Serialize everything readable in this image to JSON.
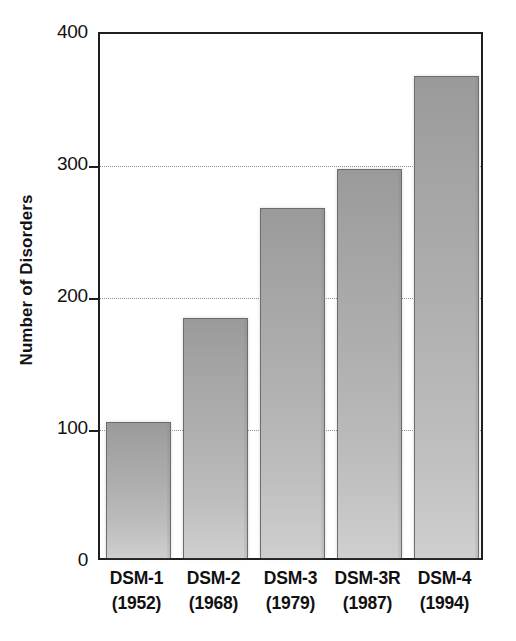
{
  "chart_data": {
    "type": "bar",
    "title": "",
    "subtitle": "",
    "xlabel": "",
    "ylabel": "Number of Disorders",
    "categories": [
      "DSM-1",
      "DSM-2",
      "DSM-3",
      "DSM-3R",
      "DSM-4"
    ],
    "category_years": [
      "(1952)",
      "(1968)",
      "(1979)",
      "(1987)",
      "(1994)"
    ],
    "values": [
      103,
      182,
      265,
      295,
      365
    ],
    "ylim": [
      0,
      400
    ],
    "y_ticks": [
      0,
      100,
      200,
      300,
      400
    ],
    "y_tick_labels": [
      "0",
      "100",
      "200",
      "300",
      "400"
    ],
    "gridlines_at": [
      100,
      200,
      300
    ],
    "grid": true,
    "legend": false,
    "legend_position": "none",
    "bars": [
      {
        "category": "DSM-1",
        "year": "(1952)",
        "label_line1": "DSM-1",
        "label_line2": "(1952)",
        "value": 103
      },
      {
        "category": "DSM-2",
        "year": "(1968)",
        "label_line1": "DSM-2",
        "label_line2": "(1968)",
        "value": 182
      },
      {
        "category": "DSM-3",
        "year": "(1979)",
        "label_line1": "DSM-3",
        "label_line2": "(1979)",
        "value": 265
      },
      {
        "category": "DSM-3R",
        "year": "(1987)",
        "label_line1": "DSM-3R",
        "label_line2": "(1987)",
        "value": 295
      },
      {
        "category": "DSM-4",
        "year": "(1994)",
        "label_line1": "DSM-4",
        "label_line2": "(1994)",
        "value": 365
      }
    ],
    "colors": {
      "bar_gradient_top": "#9a9a9a",
      "bar_gradient_bottom": "#cfcfcf",
      "bar_outline": "#6d6d6d",
      "axis": "#1f1f1f",
      "gridline": "#8f8f8f",
      "text": "#111111",
      "background": "#ffffff"
    }
  }
}
